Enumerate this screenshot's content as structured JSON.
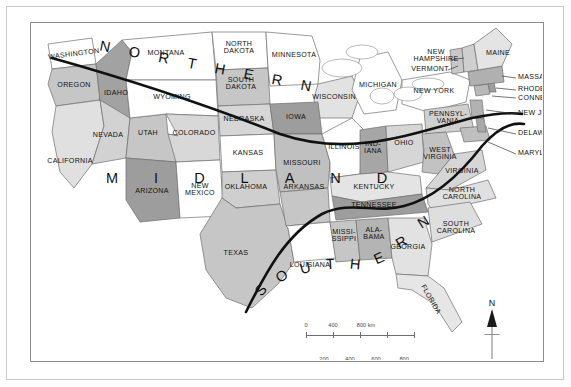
{
  "map": {
    "title": "Dialect regions of the United States",
    "regions": [
      {
        "name": "NORTHERN",
        "letters": [
          "N",
          "O",
          "R",
          "T",
          "H",
          "E",
          "R",
          "N"
        ]
      },
      {
        "name": "MIDLAND",
        "letters": [
          "M",
          "I",
          "D",
          "L",
          "A",
          "N",
          "D"
        ]
      },
      {
        "name": "SOUTHERN",
        "letters": [
          "S",
          "O",
          "U",
          "T",
          "H",
          "E",
          "R",
          "N"
        ]
      }
    ],
    "state_labels": [
      {
        "name": "WASHINGTON",
        "line1": "WASHINGTON"
      },
      {
        "name": "OREGON",
        "line1": "OREGON"
      },
      {
        "name": "IDAHO",
        "line1": "IDAHO"
      },
      {
        "name": "MONTANA",
        "line1": "MONTANA"
      },
      {
        "name": "WYOMING",
        "line1": "WYOMING"
      },
      {
        "name": "NORTH DAKOTA",
        "line1": "NORTH",
        "line2": "DAKOTA"
      },
      {
        "name": "SOUTH DAKOTA",
        "line1": "SOUTH",
        "line2": "DAKOTA"
      },
      {
        "name": "MINNESOTA",
        "line1": "MINNESOTA"
      },
      {
        "name": "WISCONSIN",
        "line1": "WISCONSIN"
      },
      {
        "name": "MICHIGAN",
        "line1": "MICHIGAN"
      },
      {
        "name": "NEVADA",
        "line1": "NEVADA"
      },
      {
        "name": "UTAH",
        "line1": "UTAH"
      },
      {
        "name": "CALIFORNIA",
        "line1": "CALIFORNIA"
      },
      {
        "name": "COLORADO",
        "line1": "COLORADO"
      },
      {
        "name": "NEBRASKA",
        "line1": "NEBRASKA"
      },
      {
        "name": "IOWA",
        "line1": "IOWA"
      },
      {
        "name": "ILLINOIS",
        "line1": "ILLINOIS"
      },
      {
        "name": "INDIANA",
        "line1": "IND-",
        "line2": "IANA"
      },
      {
        "name": "OHIO",
        "line1": "OHIO"
      },
      {
        "name": "KANSAS",
        "line1": "KANSAS"
      },
      {
        "name": "MISSOURI",
        "line1": "MISSOURI"
      },
      {
        "name": "KENTUCKY",
        "line1": "KENTUCKY"
      },
      {
        "name": "WEST VIRGINIA",
        "line1": "WEST",
        "line2": "VIRGINIA"
      },
      {
        "name": "VIRGINIA",
        "line1": "VIRGINIA"
      },
      {
        "name": "ARIZONA",
        "line1": "ARIZONA"
      },
      {
        "name": "NEW MEXICO",
        "line1": "NEW",
        "line2": "MEXICO"
      },
      {
        "name": "OKLAHOMA",
        "line1": "OKLAHOMA"
      },
      {
        "name": "ARKANSAS",
        "line1": "ARKANSAS"
      },
      {
        "name": "TENNESSEE",
        "line1": "TENNESSEE"
      },
      {
        "name": "NORTH CAROLINA",
        "line1": "NORTH",
        "line2": "CAROLINA"
      },
      {
        "name": "SOUTH CAROLINA",
        "line1": "SOUTH",
        "line2": "CAROLINA"
      },
      {
        "name": "TEXAS",
        "line1": "TEXAS"
      },
      {
        "name": "LOUISIANA",
        "line1": "LOUISIANA"
      },
      {
        "name": "MISSISSIPPI",
        "line1": "MISSI-",
        "line2": "SSIPPI"
      },
      {
        "name": "ALABAMA",
        "line1": "ALA-",
        "line2": "BAMA"
      },
      {
        "name": "GEORGIA",
        "line1": "GEORGIA"
      },
      {
        "name": "FLORIDA",
        "line1": "FLORIDA"
      },
      {
        "name": "NEW YORK",
        "line1": "NEW YORK"
      },
      {
        "name": "PENNSYLVANIA",
        "line1": "PENNSYL-",
        "line2": "VANIA"
      },
      {
        "name": "MAINE",
        "line1": "MAINE"
      },
      {
        "name": "NEW HAMPSHIRE",
        "line1": "NEW",
        "line2": "HAMPSHIRE"
      },
      {
        "name": "VERMONT",
        "line1": "VERMONT"
      },
      {
        "name": "MASSACHUSETTS",
        "line1": "MASSACHUSETTS"
      },
      {
        "name": "RHODE ISLAND",
        "line1": "RHODE ISLAND"
      },
      {
        "name": "CONNECTICUT",
        "line1": "CONNECTICUT"
      },
      {
        "name": "NEW JERSEY",
        "line1": "NEW JERSEY"
      },
      {
        "name": "DELAWARE",
        "line1": "DELAWARE"
      },
      {
        "name": "MARYLAND",
        "line1": "MARYLAND"
      }
    ],
    "scale": {
      "km_labels": [
        "0",
        "400",
        "800 km"
      ],
      "mile_labels": [
        "200",
        "400",
        "600",
        "800 miles"
      ]
    },
    "compass": {
      "north": "N"
    },
    "colors": {
      "land_light": "#e8e8e8",
      "land_mid": "#c6c6c6",
      "land_dark": "#a2a2a2",
      "land_white": "#ffffff",
      "boundary": "#111111",
      "outline": "#6f6f6f"
    }
  }
}
